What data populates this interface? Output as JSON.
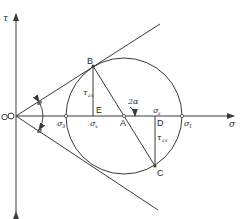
{
  "diagram": {
    "axes": {
      "horizontal_label": "σ",
      "vertical_label": "τ",
      "origin_label": "O"
    },
    "points": {
      "B": "B",
      "C": "C",
      "A": "A",
      "D": "D",
      "E": "E"
    },
    "stress_labels": {
      "sigma3": "σ",
      "sigma3_sub": "3",
      "sigmax": "σ",
      "sigmax_sub": "x",
      "sigmaz": "σ",
      "sigmaz_sub": "z",
      "sigma1": "σ",
      "sigma1_sub": "1",
      "tau_zx_top": "τ",
      "tau_zx_top_sub": "zx",
      "tau_zx_bottom": "τ",
      "tau_zx_bottom_sub": "zx"
    },
    "angles": {
      "phi_upper": "ø",
      "phi_lower": "ø",
      "two_alpha": "2α"
    },
    "colors": {
      "line": "#3a3a3a",
      "background": "#ffffff"
    }
  }
}
